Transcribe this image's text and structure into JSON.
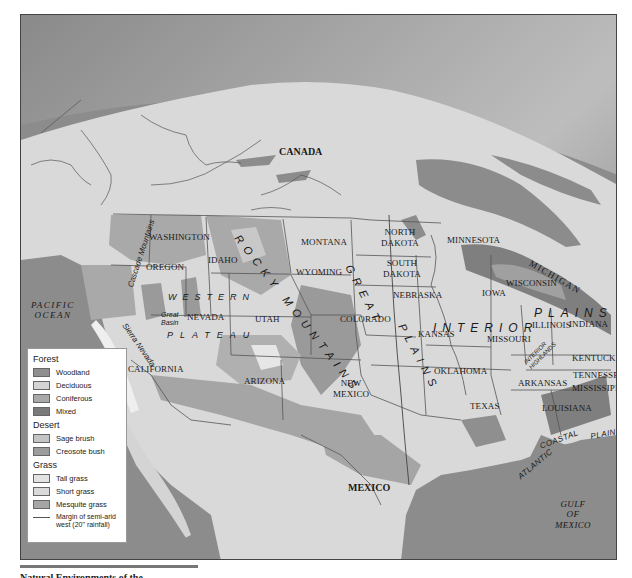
{
  "map": {
    "title_region": "North America vegetation / physiographic map",
    "countries": [
      {
        "name": "CANADA"
      },
      {
        "name": "MEXICO"
      }
    ],
    "water_bodies": {
      "pacific": "PACIFIC OCEAN",
      "pacific_line1": "PACIFIC",
      "pacific_line2": "OCEAN",
      "gulf_line1": "GULF",
      "gulf_line2": "OF",
      "gulf_line3": "MEXICO"
    },
    "states": {
      "washington": "WASHINGTON",
      "oregon": "OREGON",
      "idaho": "IDAHO",
      "montana": "MONTANA",
      "wyoming": "WYOMING",
      "north_dakota_1": "NORTH",
      "north_dakota_2": "DAKOTA",
      "south_dakota_1": "SOUTH",
      "south_dakota_2": "DAKOTA",
      "minnesota": "MINNESOTA",
      "michigan": "MICHIGAN",
      "wisconsin": "WISCONSIN",
      "iowa": "IOWA",
      "nebraska": "NEBRASKA",
      "nevada": "NEVADA",
      "utah": "UTAH",
      "colorado": "COLORADO",
      "kansas": "KANSAS",
      "missouri": "MISSOURI",
      "illinois": "ILLINOIS",
      "indiana": "INDIANA",
      "kentucky": "KENTUCKY",
      "tennessee": "TENNESSEE",
      "california": "CALIFORNIA",
      "arizona": "ARIZONA",
      "new_mexico_1": "NEW",
      "new_mexico_2": "MEXICO",
      "oklahoma": "OKLAHOMA",
      "arkansas": "ARKANSAS",
      "mississippi": "MISSISSIPPI",
      "texas": "TEXAS",
      "louisiana": "LOUISIANA"
    },
    "regions": {
      "rocky_mountains": "ROCKY MOUNTAINS",
      "rocky_1": "ROCKY",
      "rocky_2": "MOUNTAINS",
      "great_plains_1": "GREAT",
      "great_plains_2": "PLAINS",
      "interior_plains_1": "INTERIOR",
      "interior_plains_2": "PLAINS",
      "western_plateau_1": "WESTERN",
      "western_plateau_2": "PLATEAU",
      "great_basin_1": "Great",
      "great_basin_2": "Basin",
      "cascade_mountains": "Cascade Mountains",
      "sierra_nevada": "Sierra Nevada",
      "interior_highlands_1": "INTERIOR",
      "interior_highlands_2": "HIGHLANDS",
      "atlantic": "ATLANTIC",
      "coastal": "COASTAL",
      "plain": "PLAIN"
    }
  },
  "legend": {
    "groups": [
      {
        "title": "Forest",
        "items": [
          {
            "label": "Woodland",
            "color": "#8f8f8f"
          },
          {
            "label": "Deciduous",
            "color": "#d4d4d4"
          },
          {
            "label": "Coniferous",
            "color": "#a9a9a9"
          },
          {
            "label": "Mixed",
            "color": "#7a7a7a"
          }
        ]
      },
      {
        "title": "Desert",
        "items": [
          {
            "label": "Sage brush",
            "color": "#c4c4c4"
          },
          {
            "label": "Creosote bush",
            "color": "#9c9c9c"
          }
        ]
      },
      {
        "title": "Grass",
        "items": [
          {
            "label": "Tall grass",
            "color": "#e2e2e2"
          },
          {
            "label": "Short grass",
            "color": "#dadada"
          },
          {
            "label": "Mesquite grass",
            "color": "#a5a5a5"
          }
        ]
      }
    ],
    "line_note_1": "Margin of semi-arid",
    "line_note_2": "west (20\" rainfall)"
  },
  "caption": {
    "text": "Natural Environments of the"
  },
  "colors": {
    "water": "#8c8c8c",
    "land": "#d9d9d9",
    "sky_top": "#6a6a6a",
    "sky_glow": "#f2f2f2",
    "border_line": "#555555"
  }
}
